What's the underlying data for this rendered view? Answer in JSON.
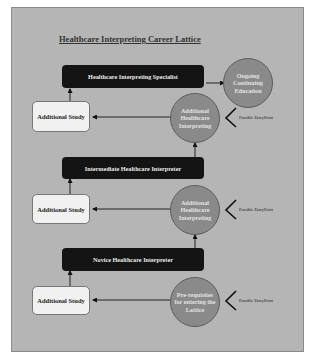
{
  "diagram": {
    "title": "Healthcare Interpreting Career Lattice",
    "levels": [
      {
        "role": "Healthcare Interpreting Specialist",
        "next": "Ongoing Continuing Education",
        "side_study": "Additional Study",
        "entry_circle": "Additional Healthcare Interpreting",
        "entry_label": "Possible EntryPoint"
      },
      {
        "role": "Intermediate Healthcare Interpreter",
        "side_study": "Additional Study",
        "entry_circle": "Additional Healthcare Interpreting",
        "entry_label": "Possible EntryPoint"
      },
      {
        "role": "Novice Healthcare Interpreter",
        "side_study": "Additional Study",
        "entry_circle": "Pre-requisites for entering the Lattice",
        "entry_label": "Possible EntryPoint"
      }
    ],
    "colors": {
      "background": "#b5b5b5",
      "role_box": "#141414",
      "study_box": "#f1f1f1",
      "circle": "#8a8a8a"
    }
  }
}
